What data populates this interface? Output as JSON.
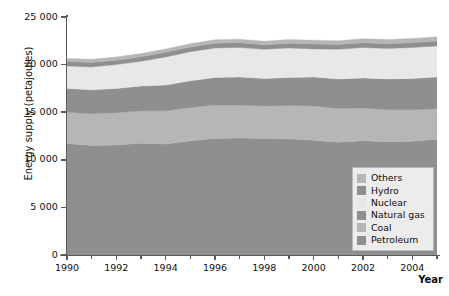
{
  "chart_data": {
    "type": "area",
    "stacked": true,
    "title": "",
    "subtitle": "",
    "xlabel": "Year",
    "ylabel": "Energy supply (petajoules)",
    "xlim": [
      1990,
      2005
    ],
    "ylim": [
      0,
      25000
    ],
    "ytick_labels": [
      "0",
      "5 000",
      "10 000",
      "15 000",
      "20 000",
      "25 000"
    ],
    "ytick_values": [
      0,
      5000,
      10000,
      15000,
      20000,
      25000
    ],
    "xtick_labels": [
      "1990",
      "1992",
      "1994",
      "1996",
      "1998",
      "2000",
      "2002",
      "2004"
    ],
    "xtick_values": [
      1990,
      1992,
      1994,
      1996,
      1998,
      2000,
      2002,
      2004
    ],
    "xtick_minor_values": [
      1991,
      1993,
      1995,
      1997,
      1999,
      2001,
      2003,
      2005
    ],
    "grid": false,
    "legend_position": "bottom-right",
    "x": [
      1990,
      1991,
      1992,
      1993,
      1994,
      1995,
      1996,
      1997,
      1998,
      1999,
      2000,
      2001,
      2002,
      2003,
      2004,
      2005
    ],
    "series": [
      {
        "name": "Petroleum",
        "color": "#8f8f8f",
        "values": [
          11700,
          11500,
          11550,
          11750,
          11650,
          12000,
          12250,
          12300,
          12250,
          12200,
          12050,
          11850,
          12000,
          11900,
          11950,
          12150
        ]
      },
      {
        "name": "Coal",
        "color": "#b6b6b6",
        "values": [
          3300,
          3350,
          3400,
          3400,
          3500,
          3500,
          3500,
          3450,
          3400,
          3500,
          3600,
          3550,
          3450,
          3350,
          3300,
          3200
        ]
      },
      {
        "name": "Natural gas",
        "color": "#8f8f8f",
        "values": [
          2500,
          2500,
          2550,
          2600,
          2700,
          2800,
          2900,
          2950,
          2900,
          2950,
          3050,
          3100,
          3150,
          3250,
          3300,
          3350
        ]
      },
      {
        "name": "Nuclear",
        "color": "#e8e8e8",
        "values": [
          2350,
          2400,
          2500,
          2600,
          2950,
          3050,
          3100,
          3100,
          3050,
          3100,
          2950,
          3100,
          3200,
          3200,
          3250,
          3250
        ]
      },
      {
        "name": "Hydro",
        "color": "#8f8f8f",
        "values": [
          480,
          480,
          470,
          480,
          500,
          500,
          500,
          500,
          490,
          500,
          520,
          500,
          500,
          500,
          510,
          520
        ]
      },
      {
        "name": "Others",
        "color": "#b6b6b6",
        "values": [
          320,
          320,
          330,
          330,
          340,
          350,
          360,
          370,
          370,
          380,
          400,
          400,
          420,
          430,
          440,
          450
        ]
      }
    ]
  },
  "legend": {
    "items": [
      {
        "label": "Others",
        "color": "#b6b6b6"
      },
      {
        "label": "Hydro",
        "color": "#8f8f8f"
      },
      {
        "label": "Nuclear",
        "color": "#e8e8e8"
      },
      {
        "label": "Natural gas",
        "color": "#8f8f8f"
      },
      {
        "label": "Coal",
        "color": "#b6b6b6"
      },
      {
        "label": "Petroleum",
        "color": "#8f8f8f"
      }
    ]
  },
  "axes": {
    "y_title": "Energy supply (petajoules)",
    "x_title": "Year"
  },
  "colors": {
    "axis": "#5a5a5a",
    "text": "#101010",
    "legend_background": "#ececed",
    "legend_border": "#b9b9ba",
    "plot_background": "#ffffff"
  }
}
